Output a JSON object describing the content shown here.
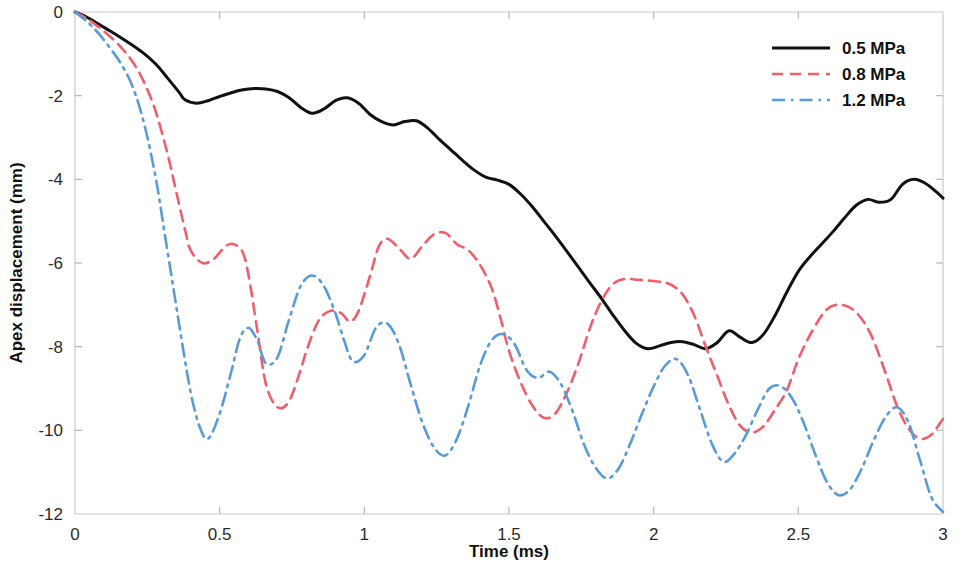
{
  "chart_data": {
    "type": "line",
    "title": "",
    "xlabel": "Time (ms)",
    "ylabel": "Apex displacement (mm)",
    "xlim": [
      0,
      3
    ],
    "ylim": [
      -12,
      0
    ],
    "xticks": [
      0,
      0.5,
      1,
      1.5,
      2,
      2.5,
      3
    ],
    "xtick_labels": [
      "0",
      "0.5",
      "1",
      "1.5",
      "2",
      "2.5",
      "3"
    ],
    "yticks": [
      0,
      -2,
      -4,
      -6,
      -8,
      -10,
      -12
    ],
    "ytick_labels": [
      "0",
      "-2",
      "-4",
      "-6",
      "-8",
      "-10",
      "-12"
    ],
    "grid": false,
    "legend_position": "top-right",
    "series": [
      {
        "name": "0.5 MPa",
        "color": "#111111",
        "style": "solid",
        "width": 3.0,
        "x": [
          0.0,
          0.04,
          0.08,
          0.12,
          0.16,
          0.2,
          0.24,
          0.28,
          0.32,
          0.36,
          0.38,
          0.42,
          0.46,
          0.5,
          0.54,
          0.58,
          0.62,
          0.66,
          0.7,
          0.74,
          0.78,
          0.82,
          0.86,
          0.9,
          0.94,
          0.98,
          1.02,
          1.06,
          1.1,
          1.14,
          1.18,
          1.22,
          1.26,
          1.3,
          1.34,
          1.38,
          1.42,
          1.46,
          1.5,
          1.54,
          1.58,
          1.62,
          1.66,
          1.7,
          1.74,
          1.78,
          1.82,
          1.86,
          1.9,
          1.94,
          1.98,
          2.02,
          2.06,
          2.1,
          2.14,
          2.18,
          2.22,
          2.26,
          2.3,
          2.34,
          2.38,
          2.42,
          2.46,
          2.5,
          2.54,
          2.58,
          2.62,
          2.66,
          2.7,
          2.74,
          2.78,
          2.82,
          2.86,
          2.9,
          2.94,
          2.98,
          3.0
        ],
        "y": [
          0.0,
          -0.12,
          -0.28,
          -0.45,
          -0.62,
          -0.8,
          -1.0,
          -1.25,
          -1.58,
          -1.92,
          -2.1,
          -2.18,
          -2.12,
          -2.02,
          -1.93,
          -1.86,
          -1.83,
          -1.84,
          -1.9,
          -2.05,
          -2.28,
          -2.42,
          -2.32,
          -2.12,
          -2.05,
          -2.18,
          -2.45,
          -2.62,
          -2.7,
          -2.62,
          -2.6,
          -2.78,
          -3.05,
          -3.3,
          -3.55,
          -3.78,
          -3.95,
          -4.02,
          -4.12,
          -4.35,
          -4.65,
          -5.0,
          -5.35,
          -5.72,
          -6.1,
          -6.48,
          -6.85,
          -7.25,
          -7.62,
          -7.92,
          -8.05,
          -7.98,
          -7.9,
          -7.88,
          -7.95,
          -8.05,
          -7.9,
          -7.62,
          -7.78,
          -7.9,
          -7.7,
          -7.25,
          -6.7,
          -6.2,
          -5.85,
          -5.55,
          -5.25,
          -4.92,
          -4.62,
          -4.48,
          -4.55,
          -4.48,
          -4.12,
          -4.0,
          -4.1,
          -4.32,
          -4.45
        ]
      },
      {
        "name": "0.8 MPa",
        "color": "#EE5E6B",
        "style": "dashed",
        "width": 2.6,
        "x": [
          0.0,
          0.04,
          0.08,
          0.12,
          0.16,
          0.2,
          0.24,
          0.28,
          0.32,
          0.35,
          0.38,
          0.4,
          0.44,
          0.48,
          0.52,
          0.55,
          0.58,
          0.6,
          0.63,
          0.66,
          0.7,
          0.74,
          0.78,
          0.8,
          0.84,
          0.88,
          0.92,
          0.95,
          0.98,
          1.02,
          1.05,
          1.08,
          1.12,
          1.16,
          1.2,
          1.24,
          1.28,
          1.32,
          1.36,
          1.4,
          1.44,
          1.47,
          1.5,
          1.54,
          1.58,
          1.62,
          1.66,
          1.7,
          1.74,
          1.78,
          1.82,
          1.86,
          1.9,
          1.94,
          1.98,
          2.02,
          2.06,
          2.1,
          2.14,
          2.18,
          2.22,
          2.26,
          2.3,
          2.34,
          2.38,
          2.42,
          2.46,
          2.5,
          2.55,
          2.6,
          2.65,
          2.7,
          2.75,
          2.8,
          2.84,
          2.88,
          2.92,
          2.96,
          3.0
        ],
        "y": [
          0.0,
          -0.15,
          -0.35,
          -0.58,
          -0.85,
          -1.2,
          -1.7,
          -2.4,
          -3.4,
          -4.3,
          -5.2,
          -5.7,
          -6.0,
          -5.9,
          -5.6,
          -5.55,
          -5.75,
          -6.3,
          -7.6,
          -8.9,
          -9.45,
          -9.3,
          -8.55,
          -8.1,
          -7.4,
          -7.15,
          -7.2,
          -7.4,
          -7.15,
          -6.3,
          -5.6,
          -5.42,
          -5.65,
          -5.9,
          -5.6,
          -5.32,
          -5.28,
          -5.55,
          -5.7,
          -6.05,
          -6.6,
          -7.3,
          -8.1,
          -8.85,
          -9.4,
          -9.7,
          -9.6,
          -9.1,
          -8.4,
          -7.55,
          -6.9,
          -6.5,
          -6.38,
          -6.4,
          -6.42,
          -6.45,
          -6.52,
          -6.75,
          -7.25,
          -8.0,
          -8.7,
          -9.4,
          -9.9,
          -10.05,
          -9.9,
          -9.5,
          -9.05,
          -8.3,
          -7.6,
          -7.1,
          -7.0,
          -7.18,
          -7.7,
          -8.6,
          -9.4,
          -9.95,
          -10.2,
          -10.1,
          -9.72
        ]
      },
      {
        "name": "1.2 MPa",
        "color": "#5B9BD5",
        "style": "dashdot",
        "width": 2.6,
        "x": [
          0.0,
          0.04,
          0.08,
          0.12,
          0.16,
          0.2,
          0.24,
          0.28,
          0.31,
          0.34,
          0.37,
          0.4,
          0.43,
          0.46,
          0.5,
          0.54,
          0.57,
          0.6,
          0.63,
          0.66,
          0.7,
          0.74,
          0.78,
          0.82,
          0.86,
          0.9,
          0.93,
          0.96,
          1.0,
          1.04,
          1.08,
          1.12,
          1.16,
          1.2,
          1.24,
          1.28,
          1.32,
          1.36,
          1.4,
          1.44,
          1.48,
          1.52,
          1.56,
          1.6,
          1.64,
          1.68,
          1.72,
          1.76,
          1.8,
          1.84,
          1.88,
          1.92,
          1.96,
          2.0,
          2.04,
          2.08,
          2.12,
          2.16,
          2.2,
          2.24,
          2.28,
          2.32,
          2.36,
          2.4,
          2.44,
          2.48,
          2.52,
          2.56,
          2.6,
          2.64,
          2.68,
          2.72,
          2.76,
          2.8,
          2.84,
          2.88,
          2.92,
          2.96,
          3.0
        ],
        "y": [
          0.0,
          -0.22,
          -0.5,
          -0.85,
          -1.25,
          -1.8,
          -2.7,
          -4.0,
          -5.3,
          -6.6,
          -7.9,
          -9.1,
          -9.9,
          -10.2,
          -9.6,
          -8.6,
          -7.8,
          -7.55,
          -7.85,
          -8.4,
          -8.25,
          -7.35,
          -6.55,
          -6.3,
          -6.55,
          -7.2,
          -7.85,
          -8.35,
          -8.2,
          -7.55,
          -7.45,
          -7.95,
          -8.9,
          -9.8,
          -10.4,
          -10.6,
          -10.2,
          -9.4,
          -8.45,
          -7.85,
          -7.7,
          -7.95,
          -8.55,
          -8.75,
          -8.6,
          -8.9,
          -9.55,
          -10.35,
          -10.9,
          -11.15,
          -10.9,
          -10.3,
          -9.6,
          -8.95,
          -8.45,
          -8.3,
          -8.7,
          -9.5,
          -10.3,
          -10.75,
          -10.55,
          -10.1,
          -9.5,
          -9.0,
          -8.95,
          -9.25,
          -9.85,
          -10.6,
          -11.25,
          -11.55,
          -11.4,
          -10.9,
          -10.25,
          -9.7,
          -9.45,
          -9.8,
          -10.7,
          -11.6,
          -11.95
        ]
      }
    ]
  },
  "legend": {
    "items": [
      {
        "label": "0.5 MPa"
      },
      {
        "label": "0.8 MPa"
      },
      {
        "label": "1.2 MPa"
      }
    ]
  }
}
